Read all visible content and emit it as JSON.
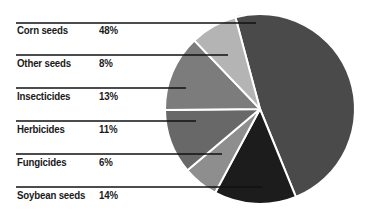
{
  "chart_data": {
    "type": "pie",
    "title": "",
    "categories": [
      "Corn seeds",
      "Other seeds",
      "Insecticides",
      "Herbicides",
      "Fungicides",
      "Soybean seeds"
    ],
    "values": [
      48,
      8,
      13,
      11,
      6,
      14
    ],
    "value_labels": [
      "48%",
      "8%",
      "13%",
      "11%",
      "6%",
      "14%"
    ],
    "unit": "%",
    "legend_position": "left, leader lines to slices",
    "grid": false,
    "slices": [
      {
        "label": "Corn seeds",
        "value": 48,
        "display": "48%",
        "color": "#4a4a4a"
      },
      {
        "label": "Soybean seeds",
        "value": 14,
        "display": "14%",
        "color": "#1c1c1c"
      },
      {
        "label": "Fungicides",
        "value": 6,
        "display": "6%",
        "color": "#8e8e8e"
      },
      {
        "label": "Herbicides",
        "value": 11,
        "display": "11%",
        "color": "#686868"
      },
      {
        "label": "Insecticides",
        "value": 13,
        "display": "13%",
        "color": "#7c7c7c"
      },
      {
        "label": "Other seeds",
        "value": 8,
        "display": "8%",
        "color": "#b4b4b4"
      }
    ],
    "start_angle_deg": -15
  },
  "labels": [
    {
      "name": "Corn seeds",
      "pct": "48%"
    },
    {
      "name": "Other seeds",
      "pct": "8%"
    },
    {
      "name": "Insecticides",
      "pct": "13%"
    },
    {
      "name": "Herbicides",
      "pct": "11%"
    },
    {
      "name": "Fungicides",
      "pct": "6%"
    },
    {
      "name": "Soybean seeds",
      "pct": "14%"
    }
  ]
}
